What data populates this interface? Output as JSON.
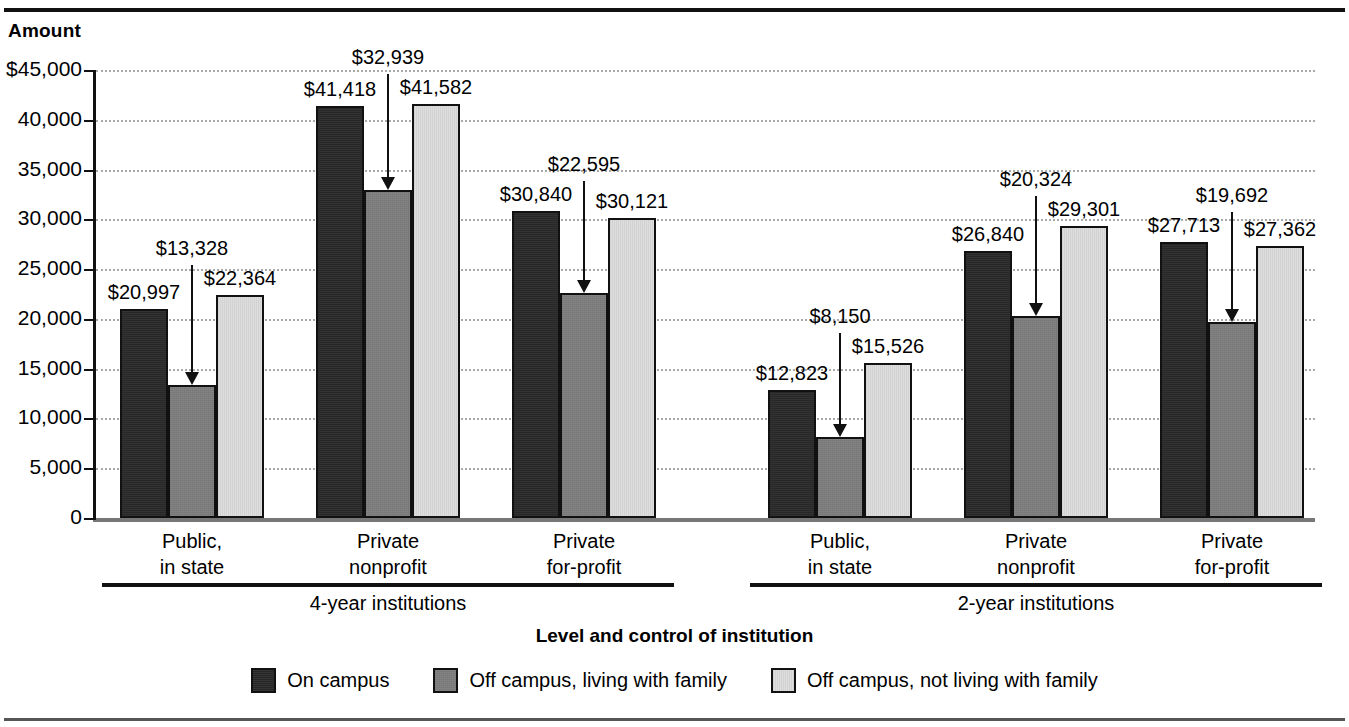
{
  "figure": {
    "y_axis_title": "Amount",
    "x_axis_title": "Level and control of institution"
  },
  "chart_data": {
    "type": "bar",
    "title": "",
    "xlabel": "Level and control of institution",
    "ylabel": "Amount",
    "ylim": [
      0,
      45000
    ],
    "ytick_labels": [
      "$45,000",
      "40,000",
      "35,000",
      "30,000",
      "25,000",
      "20,000",
      "15,000",
      "10,000",
      "5,000",
      "0"
    ],
    "ytick_values": [
      45000,
      40000,
      35000,
      30000,
      25000,
      20000,
      15000,
      10000,
      5000,
      0
    ],
    "grid": true,
    "legend_position": "bottom",
    "categories": [
      "Public,\nin state",
      "Private\nnonprofit",
      "Private\nfor-profit",
      "Public,\nin state",
      "Private\nnonprofit",
      "Private\nfor-profit"
    ],
    "groups": [
      {
        "label": "4-year institutions",
        "category_indices": [
          0,
          1,
          2
        ]
      },
      {
        "label": "2-year institutions",
        "category_indices": [
          3,
          4,
          5
        ]
      }
    ],
    "series": [
      {
        "name": "On campus",
        "color": "#282828",
        "values": [
          20997,
          41418,
          30840,
          12823,
          26840,
          27713
        ],
        "data_labels": [
          "$20,997",
          "$41,418",
          "$30,840",
          "$12,823",
          "$26,840",
          "$27,713"
        ]
      },
      {
        "name": "Off campus, living with family",
        "color": "#7d7d7d",
        "values": [
          13328,
          32939,
          22595,
          8150,
          20324,
          19692
        ],
        "data_labels": [
          "$13,328",
          "$32,939",
          "$22,595",
          "$8,150",
          "$20,324",
          "$19,692"
        ],
        "label_has_leader_arrow": true
      },
      {
        "name": "Off campus, not living with family",
        "color": "#dcdcdc",
        "values": [
          22364,
          41582,
          30121,
          15526,
          29301,
          27362
        ],
        "data_labels": [
          "$22,364",
          "$41,582",
          "$30,121",
          "$15,526",
          "$29,301",
          "$27,362"
        ]
      }
    ]
  }
}
